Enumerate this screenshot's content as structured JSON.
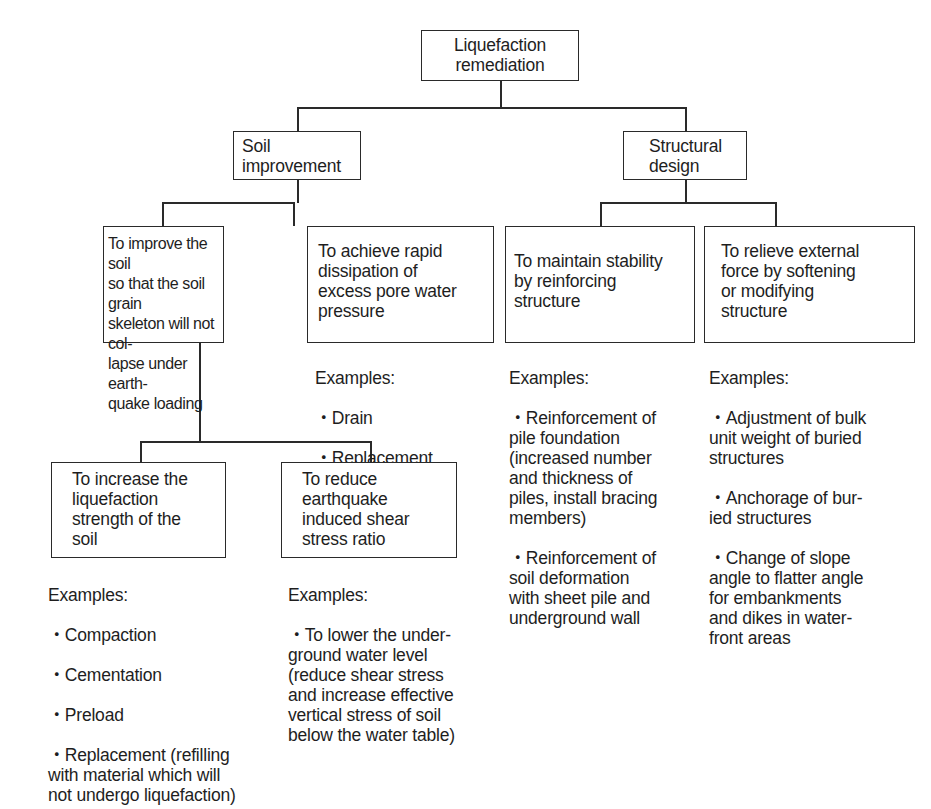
{
  "diagram": {
    "type": "tree",
    "root": {
      "label": "Liquefaction\nremediation"
    },
    "branches": [
      {
        "label": "Soil\nimprovement",
        "children": [
          {
            "label": "To improve the soil\nso that the soil grain\nskeleton will not col-\nlapse under earth-\nquake loading",
            "children": [
              {
                "label": "To increase the\nliquefaction\nstrength of the\nsoil",
                "examples_header": "Examples:",
                "examples": [
                  "・Compaction",
                  "・Cementation",
                  "・Preload",
                  "・Replacement (refilling\nwith material which will\nnot undergo liquefaction)"
                ]
              },
              {
                "label": "To reduce\nearthquake\ninduced shear\nstress ratio",
                "examples_header": "Examples:",
                "examples": [
                  "・To lower the under-\nground water level\n(reduce shear stress\nand increase effective\nvertical stress of soil\nbelow the water table)"
                ]
              }
            ]
          },
          {
            "label": "To achieve rapid\ndissipation of\nexcess pore water\npressure",
            "examples_header": "Examples:",
            "examples": [
              "・Drain",
              "・Replacement\n   (with gravel)"
            ]
          }
        ]
      },
      {
        "label": "Structural\ndesign",
        "children": [
          {
            "label": "To maintain stability\nby reinforcing\nstructure",
            "examples_header": "Examples:",
            "examples": [
              "・Reinforcement of\npile foundation\n(increased number\nand thickness of\npiles, install bracing\nmembers)",
              "・Reinforcement of\nsoil deformation\nwith sheet pile and\nunderground wall"
            ]
          },
          {
            "label": "To relieve external\nforce by softening\nor modifying\nstructure",
            "examples_header": "Examples:",
            "examples": [
              "・Adjustment of bulk\nunit weight of buried\nstructures",
              "・Anchorage of bur-\nied structures",
              "・Change of slope\nangle to flatter angle\nfor embankments\nand dikes in water-\nfront areas"
            ]
          }
        ]
      }
    ]
  }
}
